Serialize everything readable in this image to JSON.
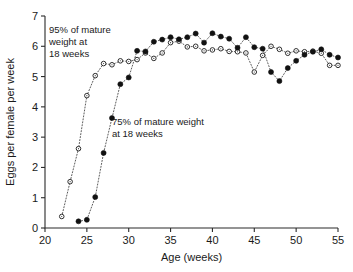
{
  "chart_data": {
    "type": "scatter",
    "title": "",
    "xlabel": "Age (weeks)",
    "ylabel": "Eggs per female per week",
    "xlim": [
      20,
      55
    ],
    "ylim": [
      0,
      7
    ],
    "xticks": [
      20,
      25,
      30,
      35,
      40,
      45,
      50,
      55
    ],
    "yticks": [
      0,
      1,
      2,
      3,
      4,
      5,
      6,
      7
    ],
    "grid": false,
    "legend_position": "none",
    "annotations": [
      {
        "name": "annotation-95-percent",
        "lines": [
          "95% of mature",
          "weight  at",
          "18 weeks"
        ],
        "target_series": "95% of mature weight at 18 weeks"
      },
      {
        "name": "annotation-75-percent",
        "lines": [
          "75% of mature weight",
          "at 18 weeks"
        ],
        "target_series": "75% of mature weight at 18 weeks"
      }
    ],
    "series": [
      {
        "name": "95% of mature weight at 18 weeks",
        "marker": "open-circle",
        "linestyle": "dotted",
        "x": [
          22,
          23,
          24,
          25,
          26,
          27,
          28,
          29,
          30,
          31,
          32,
          33,
          34,
          35,
          36,
          37,
          38,
          39,
          40,
          41,
          42,
          43,
          44,
          45,
          46,
          47,
          48,
          49,
          50,
          51,
          52,
          53,
          54,
          55
        ],
        "y": [
          0.38,
          1.53,
          2.62,
          4.37,
          5.03,
          5.43,
          5.39,
          5.52,
          5.5,
          5.56,
          5.78,
          5.6,
          5.78,
          6.12,
          6.17,
          5.98,
          6.0,
          5.85,
          5.88,
          5.92,
          5.83,
          5.82,
          5.78,
          5.15,
          5.7,
          6.0,
          5.9,
          5.77,
          5.85,
          5.82,
          5.84,
          5.77,
          5.37,
          5.37
        ]
      },
      {
        "name": "75% of mature weight at 18 weeks",
        "marker": "filled-circle",
        "linestyle": "dotted",
        "x": [
          24,
          25,
          26,
          27,
          28,
          29,
          30,
          31,
          32,
          33,
          34,
          35,
          36,
          37,
          38,
          39,
          40,
          41,
          42,
          43,
          44,
          45,
          46,
          47,
          48,
          49,
          50,
          51,
          52,
          53,
          54,
          55
        ],
        "y": [
          0.22,
          0.27,
          1.02,
          2.48,
          3.63,
          4.75,
          4.97,
          5.85,
          5.83,
          6.15,
          6.22,
          6.3,
          6.23,
          6.3,
          6.42,
          6.12,
          6.43,
          6.32,
          6.25,
          5.95,
          6.3,
          5.97,
          5.92,
          5.15,
          4.85,
          5.28,
          5.52,
          5.72,
          5.82,
          5.9,
          5.72,
          5.63
        ]
      }
    ]
  }
}
